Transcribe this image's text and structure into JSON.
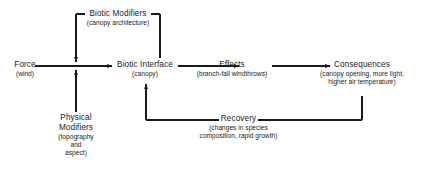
{
  "diagram": {
    "background_color": "#ffffff",
    "line_color": "#1a1a1a",
    "nodes": {
      "force": {
        "label": "Force",
        "sublabel": "(wind)"
      },
      "biotic_modifiers": {
        "label": "Biotic Modifiers",
        "sublabel": "(canopy architecture)"
      },
      "biotic_interface": {
        "label": "Biotic Interface",
        "sublabel": "(canopy)"
      },
      "effects": {
        "label": "Effects",
        "sublabel": "(branch-fall windthrows)"
      },
      "consequences": {
        "label": "Consequences",
        "sublabel_line1": "(canopy opening, more light,",
        "sublabel_line2": "higher air temperature)"
      },
      "physical_modifiers": {
        "label_line1": "Physical",
        "label_line2": "Modifiers",
        "sublabel_line1": "(topography",
        "sublabel_line2": "and",
        "sublabel_line3": "aspect)"
      },
      "recovery": {
        "label": "Recovery",
        "sublabel_line1": "(changes in species",
        "sublabel_line2": "composition, rapid growth)"
      }
    },
    "connectors": [
      {
        "name": "force-to-biotic-interface",
        "kind": "arrow",
        "direction": "right"
      },
      {
        "name": "biotic-interface-to-effects",
        "kind": "arrow",
        "direction": "right"
      },
      {
        "name": "effects-to-consequences",
        "kind": "arrow",
        "direction": "right"
      },
      {
        "name": "biotic-modifiers-to-force",
        "kind": "arrow",
        "direction": "down"
      },
      {
        "name": "biotic-modifiers-to-biotic-interface",
        "kind": "line",
        "direction": "down"
      },
      {
        "name": "physical-modifiers-to-force",
        "kind": "arrow",
        "direction": "up"
      },
      {
        "name": "consequences-to-recovery",
        "kind": "line",
        "direction": "down-left"
      },
      {
        "name": "recovery-to-biotic-interface",
        "kind": "arrow",
        "direction": "up"
      }
    ]
  }
}
